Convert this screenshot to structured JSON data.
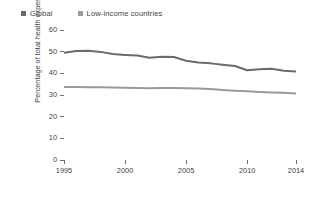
{
  "chart_data": {
    "type": "line",
    "title": "",
    "subtitle": "",
    "xlabel": "",
    "ylabel": "Percentage of total health expenditure",
    "xlim": [
      1995,
      2014
    ],
    "ylim": [
      0,
      60
    ],
    "ytick_values": [
      60,
      50,
      40,
      30,
      20,
      10,
      0
    ],
    "ytick_labels": [
      "60",
      "50",
      "40",
      "30",
      "20",
      "10",
      "0"
    ],
    "xtick_values": [
      1995,
      2000,
      2005,
      2010,
      2014
    ],
    "xtick_labels": [
      "1995",
      "2000",
      "2005",
      "2010",
      "2014"
    ],
    "grid": false,
    "legend_position": "top-left",
    "x": [
      1995,
      1996,
      1997,
      1998,
      1999,
      2000,
      2001,
      2002,
      2003,
      2004,
      2005,
      2006,
      2007,
      2008,
      2009,
      2010,
      2011,
      2012,
      2013,
      2014
    ],
    "series": [
      {
        "name": "Global",
        "color": "#6b6b6b",
        "values": [
          49.5,
          50.3,
          50.4,
          49.9,
          48.9,
          48.5,
          48.2,
          47.2,
          47.6,
          47.5,
          45.8,
          45.0,
          44.6,
          44.0,
          43.4,
          41.4,
          41.9,
          42.1,
          41.2,
          40.8
        ]
      },
      {
        "name": "Low-income countries",
        "color": "#9a9a9a",
        "values": [
          33.7,
          33.7,
          33.6,
          33.6,
          33.5,
          33.3,
          33.2,
          33.1,
          33.2,
          33.2,
          33.1,
          33.0,
          32.8,
          32.3,
          32.0,
          31.7,
          31.4,
          31.2,
          31.0,
          30.7
        ]
      }
    ]
  },
  "legend": {
    "items": [
      {
        "label": "Global",
        "color": "#6b6b6b"
      },
      {
        "label": "Low-income countries",
        "color": "#9a9a9a"
      }
    ]
  },
  "axes": {
    "y_title": "Percentage of total health expenditure"
  }
}
